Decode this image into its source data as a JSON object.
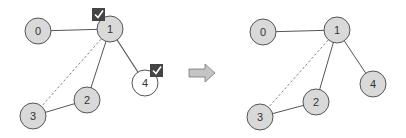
{
  "colors": {
    "node_fill": "#d9d9d9",
    "node_fill_highlight": "#ffffff",
    "node_stroke": "#555555",
    "edge": "#555555",
    "check_bg": "#444444",
    "check_mark": "#ffffff",
    "arrow_fill": "#bfbfbf",
    "arrow_stroke": "#777777"
  },
  "before": {
    "nodes": [
      {
        "id": "0",
        "label": "0",
        "x": 38,
        "y": 31,
        "highlight": false
      },
      {
        "id": "1",
        "label": "1",
        "x": 110,
        "y": 29,
        "highlight": false
      },
      {
        "id": "2",
        "label": "2",
        "x": 87,
        "y": 100,
        "highlight": false
      },
      {
        "id": "3",
        "label": "3",
        "x": 33,
        "y": 116,
        "highlight": false
      },
      {
        "id": "4",
        "label": "4",
        "x": 145,
        "y": 83,
        "highlight": true
      }
    ],
    "edges": [
      {
        "from": "0",
        "to": "1",
        "style": "solid"
      },
      {
        "from": "1",
        "to": "2",
        "style": "solid"
      },
      {
        "from": "1",
        "to": "4",
        "style": "solid"
      },
      {
        "from": "2",
        "to": "3",
        "style": "solid"
      },
      {
        "from": "1",
        "to": "3",
        "style": "dashed"
      }
    ],
    "checkmarks": [
      {
        "on": "1",
        "x": 98,
        "y": 15
      },
      {
        "on": "4",
        "x": 156,
        "y": 71
      }
    ]
  },
  "transition_arrow": {
    "icon": "right-arrow-icon",
    "x": 188,
    "y": 73
  },
  "after": {
    "nodes": [
      {
        "id": "0",
        "label": "0",
        "x": 263,
        "y": 32
      },
      {
        "id": "1",
        "label": "1",
        "x": 337,
        "y": 30
      },
      {
        "id": "2",
        "label": "2",
        "x": 316,
        "y": 102
      },
      {
        "id": "3",
        "label": "3",
        "x": 260,
        "y": 117
      },
      {
        "id": "4",
        "label": "4",
        "x": 373,
        "y": 84
      }
    ],
    "edges": [
      {
        "from": "0",
        "to": "1",
        "style": "solid"
      },
      {
        "from": "1",
        "to": "2",
        "style": "solid"
      },
      {
        "from": "1",
        "to": "4",
        "style": "solid"
      },
      {
        "from": "2",
        "to": "3",
        "style": "solid"
      },
      {
        "from": "1",
        "to": "3",
        "style": "dashed"
      }
    ]
  }
}
